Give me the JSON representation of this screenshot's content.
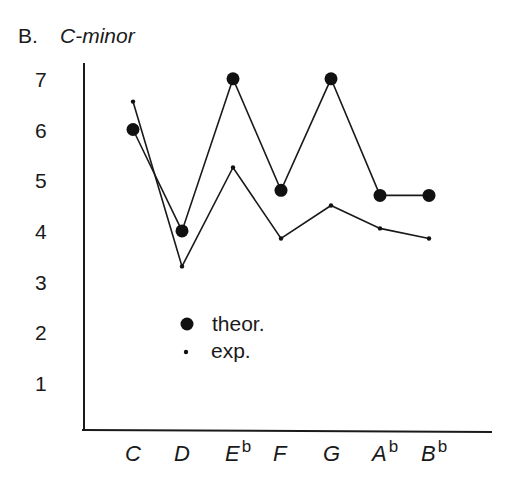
{
  "figure": {
    "panel_label": "B.",
    "key_label": "C-minor"
  },
  "chart_data": {
    "type": "line",
    "title": "C-minor",
    "panel": "B.",
    "xlabel": "",
    "ylabel": "",
    "categories": [
      "C",
      "D",
      "Eb",
      "F",
      "G",
      "Ab",
      "Bb"
    ],
    "category_display": [
      {
        "base": "C",
        "sup": ""
      },
      {
        "base": "D",
        "sup": ""
      },
      {
        "base": "E",
        "sup": "b"
      },
      {
        "base": "F",
        "sup": ""
      },
      {
        "base": "G",
        "sup": ""
      },
      {
        "base": "A",
        "sup": "b"
      },
      {
        "base": "B",
        "sup": "b"
      }
    ],
    "yticks": [
      "1",
      "2",
      "3",
      "4",
      "5",
      "6",
      "7"
    ],
    "ylim": [
      0,
      7.5
    ],
    "grid": false,
    "legend_position": "inside-lower-left",
    "series": [
      {
        "name": "theor.",
        "marker": "large-dot",
        "values": [
          6.0,
          4.0,
          7.0,
          4.8,
          7.0,
          4.7,
          4.7
        ]
      },
      {
        "name": "exp.",
        "marker": "small-dot",
        "values": [
          6.55,
          3.3,
          5.25,
          3.85,
          4.5,
          4.05,
          3.85
        ]
      }
    ]
  },
  "legend": {
    "items": [
      {
        "label": "theor."
      },
      {
        "label": "exp."
      }
    ]
  }
}
